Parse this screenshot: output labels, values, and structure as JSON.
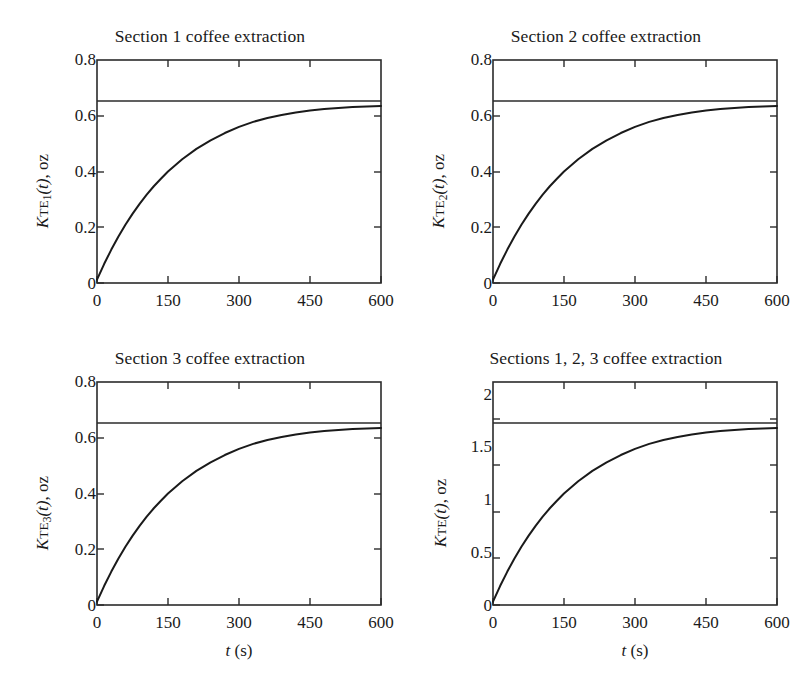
{
  "figure": {
    "background_color": "#ffffff",
    "line_color": "#1a1a1a",
    "axis_color": "#2b2b2b"
  },
  "panels": [
    {
      "id": "section-1",
      "title": "Section 1 coffee extraction",
      "legend_label": "Initial amount of coffee (oz)",
      "ylabel_prefix": "K",
      "ylabel_sub": "TE",
      "ylabel_subindex": "1",
      "ylabel_suffix": "(t), oz",
      "xlabel": "t (s)",
      "xlabel_shown": false
    },
    {
      "id": "section-2",
      "title": "Section 2 coffee extraction",
      "legend_label": "Initial amount of coffee (oz)",
      "ylabel_prefix": "K",
      "ylabel_sub": "TE",
      "ylabel_subindex": "2",
      "ylabel_suffix": "(t), oz",
      "xlabel": "t (s)",
      "xlabel_shown": false
    },
    {
      "id": "section-3",
      "title": "Section 3 coffee extraction",
      "legend_label": "Initial amount of coffee (oz)",
      "ylabel_prefix": "K",
      "ylabel_sub": "TE",
      "ylabel_subindex": "3",
      "ylabel_suffix": "(t), oz",
      "xlabel": "t (s)",
      "xlabel_shown": true
    },
    {
      "id": "sections-1-2-3",
      "title": "Sections 1, 2, 3 coffee extraction",
      "legend_label": "Initial amount of coffee (oz)",
      "ylabel_prefix": "K",
      "ylabel_sub": "TE",
      "ylabel_subindex": "",
      "ylabel_suffix": "(t), oz",
      "xlabel": "t (s)",
      "xlabel_shown": true
    }
  ],
  "chart_data": [
    {
      "type": "line",
      "id": "section-1",
      "title": "Section 1 coffee extraction",
      "xlabel": "t (s)",
      "ylabel": "K_TE1(t), oz",
      "xlim": [
        0,
        600
      ],
      "ylim": [
        0,
        0.8
      ],
      "xticks": [
        0,
        150,
        300,
        450,
        600
      ],
      "yticks": [
        0,
        0.2,
        0.4,
        0.6,
        0.8
      ],
      "xticklabels": [
        "0",
        "150",
        "300",
        "450",
        "600"
      ],
      "yticklabels": [
        "0",
        "0.2",
        "0.4",
        "0.6",
        "0.8"
      ],
      "grid": false,
      "legend": "Initial amount of coffee (oz)",
      "reference_line": {
        "label": "Initial amount of coffee (oz)",
        "value": 0.653
      },
      "x": [
        0,
        15,
        30,
        45,
        60,
        75,
        90,
        105,
        120,
        135,
        150,
        180,
        210,
        240,
        270,
        300,
        330,
        360,
        390,
        420,
        450,
        480,
        510,
        540,
        570,
        600
      ],
      "y": [
        0.012,
        0.068,
        0.119,
        0.166,
        0.209,
        0.248,
        0.284,
        0.317,
        0.347,
        0.374,
        0.4,
        0.444,
        0.481,
        0.512,
        0.538,
        0.56,
        0.578,
        0.592,
        0.603,
        0.612,
        0.619,
        0.624,
        0.628,
        0.631,
        0.633,
        0.635
      ]
    },
    {
      "type": "line",
      "id": "section-2",
      "title": "Section 2 coffee extraction",
      "xlabel": "t (s)",
      "ylabel": "K_TE2(t), oz",
      "xlim": [
        0,
        600
      ],
      "ylim": [
        0,
        0.8
      ],
      "xticks": [
        0,
        150,
        300,
        450,
        600
      ],
      "yticks": [
        0,
        0.2,
        0.4,
        0.6,
        0.8
      ],
      "xticklabels": [
        "0",
        "150",
        "300",
        "450",
        "600"
      ],
      "yticklabels": [
        "0",
        "0.2",
        "0.4",
        "0.6",
        "0.8"
      ],
      "grid": false,
      "legend": "Initial amount of coffee (oz)",
      "reference_line": {
        "label": "Initial amount of coffee (oz)",
        "value": 0.653
      },
      "x": [
        0,
        15,
        30,
        45,
        60,
        75,
        90,
        105,
        120,
        135,
        150,
        180,
        210,
        240,
        270,
        300,
        330,
        360,
        390,
        420,
        450,
        480,
        510,
        540,
        570,
        600
      ],
      "y": [
        0.012,
        0.068,
        0.119,
        0.166,
        0.209,
        0.248,
        0.284,
        0.317,
        0.347,
        0.374,
        0.4,
        0.444,
        0.481,
        0.512,
        0.538,
        0.56,
        0.578,
        0.592,
        0.603,
        0.612,
        0.619,
        0.624,
        0.628,
        0.631,
        0.633,
        0.635
      ]
    },
    {
      "type": "line",
      "id": "section-3",
      "title": "Section 3 coffee extraction",
      "xlabel": "t (s)",
      "ylabel": "K_TE3(t), oz",
      "xlim": [
        0,
        600
      ],
      "ylim": [
        0,
        0.8
      ],
      "xticks": [
        0,
        150,
        300,
        450,
        600
      ],
      "yticks": [
        0,
        0.2,
        0.4,
        0.6,
        0.8
      ],
      "xticklabels": [
        "0",
        "150",
        "300",
        "450",
        "600"
      ],
      "yticklabels": [
        "0",
        "0.2",
        "0.4",
        "0.6",
        "0.8"
      ],
      "grid": false,
      "legend": "Initial amount of coffee (oz)",
      "reference_line": {
        "label": "Initial amount of coffee (oz)",
        "value": 0.653
      },
      "x": [
        0,
        15,
        30,
        45,
        60,
        75,
        90,
        105,
        120,
        135,
        150,
        180,
        210,
        240,
        270,
        300,
        330,
        360,
        390,
        420,
        450,
        480,
        510,
        540,
        570,
        600
      ],
      "y": [
        0.012,
        0.068,
        0.119,
        0.166,
        0.209,
        0.248,
        0.284,
        0.317,
        0.347,
        0.374,
        0.4,
        0.444,
        0.481,
        0.512,
        0.538,
        0.56,
        0.578,
        0.592,
        0.603,
        0.612,
        0.619,
        0.624,
        0.628,
        0.631,
        0.633,
        0.635
      ]
    },
    {
      "type": "line",
      "id": "sections-1-2-3",
      "title": "Sections 1, 2, 3 coffee extraction",
      "xlabel": "t (s)",
      "ylabel": "K_TE(t), oz",
      "xlim": [
        0,
        600
      ],
      "ylim": [
        0,
        2.4
      ],
      "xticks": [
        0,
        150,
        300,
        450,
        600
      ],
      "yticks": [
        0,
        0.5,
        1,
        1.5,
        2
      ],
      "xticklabels": [
        "0",
        "150",
        "300",
        "450",
        "600"
      ],
      "yticklabels": [
        "0",
        "0.5",
        "1",
        "1.5",
        "2"
      ],
      "grid": false,
      "legend": "Initial amount of coffee (oz)",
      "reference_line": {
        "label": "Initial amount of coffee (oz)",
        "value": 1.96
      },
      "x": [
        0,
        15,
        30,
        45,
        60,
        75,
        90,
        105,
        120,
        135,
        150,
        180,
        210,
        240,
        270,
        300,
        330,
        360,
        390,
        420,
        450,
        480,
        510,
        540,
        570,
        600
      ],
      "y": [
        0.036,
        0.204,
        0.357,
        0.498,
        0.627,
        0.744,
        0.852,
        0.951,
        1.041,
        1.122,
        1.2,
        1.332,
        1.443,
        1.536,
        1.614,
        1.68,
        1.734,
        1.776,
        1.809,
        1.836,
        1.857,
        1.872,
        1.884,
        1.893,
        1.899,
        1.905
      ]
    }
  ]
}
